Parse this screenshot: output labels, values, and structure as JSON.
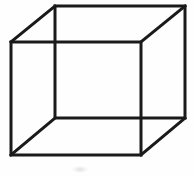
{
  "figure": {
    "name": "necker-cube",
    "title": "Necker cube",
    "width": 193,
    "height": 176,
    "background_color": "#fefefe",
    "line_color": "#1a1a1a",
    "line_width": 3
  },
  "geometry": {
    "front_face": {
      "label": "front-square",
      "points": "11,42 141,42 141,155 11,155"
    },
    "back_face": {
      "label": "back-square",
      "points": "55,6 185,6 185,118 55,118"
    },
    "connectors": [
      {
        "label": "connector-top-left",
        "x1": 11,
        "y1": 42,
        "x2": 55,
        "y2": 6
      },
      {
        "label": "connector-top-right",
        "x1": 141,
        "y1": 42,
        "x2": 185,
        "y2": 6
      },
      {
        "label": "connector-bottom-right",
        "x1": 141,
        "y1": 155,
        "x2": 185,
        "y2": 118
      },
      {
        "label": "connector-bottom-left",
        "x1": 11,
        "y1": 155,
        "x2": 55,
        "y2": 118
      }
    ],
    "vertices": [
      {
        "label": "front-top-left",
        "x": 11,
        "y": 42
      },
      {
        "label": "front-top-right",
        "x": 141,
        "y": 42
      },
      {
        "label": "front-bottom-right",
        "x": 141,
        "y": 155
      },
      {
        "label": "front-bottom-left",
        "x": 11,
        "y": 155
      },
      {
        "label": "back-top-left",
        "x": 55,
        "y": 6
      },
      {
        "label": "back-top-right",
        "x": 185,
        "y": 6
      },
      {
        "label": "back-bottom-right",
        "x": 185,
        "y": 118
      },
      {
        "label": "back-bottom-left",
        "x": 55,
        "y": 118
      }
    ]
  },
  "artifacts": {
    "smudge_label": "paper-smudge"
  }
}
